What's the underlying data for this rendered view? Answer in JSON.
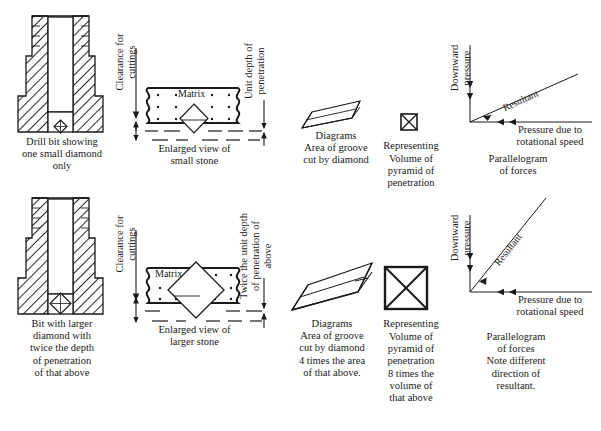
{
  "figure": {
    "colors": {
      "ink": "#1a1a1a",
      "paper": "#ffffff",
      "hatch": "#333333"
    }
  },
  "row_top": {
    "bit_caption": "Drill bit showing\none small diamond\nonly",
    "clearance_label": "Clearance for\ncuttings",
    "matrix_label": "Matrix",
    "matrix_caption": "Enlarged view of\nsmall stone",
    "depth_label": "Unit depth of\npenetration",
    "groove_caption": "Diagrams\nArea of groove\ncut by diamond",
    "pyramid_caption": "Volume of\npyramid of\npenetration",
    "representing_label": "Representing",
    "forces_caption": "Parallelogram\nof forces",
    "force_vertical_label": "Downward\npressure",
    "force_resultant_label": "Resultant",
    "force_horizontal_label": "Pressure due to\nrotational speed"
  },
  "row_bottom": {
    "bit_caption": "Bit with larger\ndiamond with\ntwice the depth\nof penetration\nof that above",
    "clearance_label": "Clearance for\ncuttings",
    "matrix_label": "Matrix",
    "matrix_caption": "Enlarged view of\nlarger stone",
    "depth_label": "Twice the unit depth\nof penetration of\nabove",
    "groove_caption": "Diagrams\nArea of groove\ncut by diamond\n4 times the area\nof that above.",
    "pyramid_caption": "Volume of\npyramid of\npenetration\n8 times the\nvolume of\nthat above",
    "representing_label": "Representing",
    "forces_caption": "Parallelogram\nof forces\nNote different\ndirection of\nresultant.",
    "force_vertical_label": "Downward\npressure",
    "force_resultant_label": "Resultant",
    "force_horizontal_label": "Pressure due to\nrotational speed"
  }
}
